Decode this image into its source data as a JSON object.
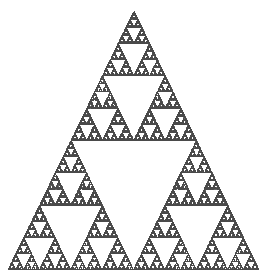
{
  "figure": {
    "background_color": "#ffffff",
    "width": 269,
    "height": 274
  },
  "chart_data": {
    "type": "scatter",
    "subtitle": "",
    "xlabel": "",
    "ylabel": "",
    "legend": [],
    "legend_position": "none",
    "grid": false,
    "axes_visible": false,
    "tick_labels_x": [],
    "tick_labels_y": [],
    "xlim": [
      0,
      269
    ],
    "ylim": [
      0,
      274
    ],
    "marker": {
      "shape": "point",
      "size_px": 1,
      "color": "#4a4a4a",
      "opacity": 0.85
    },
    "fractal": {
      "name": "Sierpinski triangle",
      "generator": "chaos-game",
      "contraction_ratio": 0.5,
      "iterations": 90000,
      "visible_recursion_depth": 6,
      "hausdorff_dimension": 1.585,
      "vertices": [
        {
          "label": "apex",
          "x": 134,
          "y": 11
        },
        {
          "label": "bottom-left",
          "x": 8,
          "y": 270
        },
        {
          "label": "bottom-right",
          "x": 259,
          "y": 270
        }
      ]
    },
    "x": [
      134,
      8,
      259,
      71,
      196,
      133
    ],
    "y": [
      11,
      270,
      270,
      140,
      140,
      270
    ],
    "series": [
      {
        "name": "attractor points",
        "point_count": 90000,
        "color": "#4a4a4a"
      }
    ]
  }
}
